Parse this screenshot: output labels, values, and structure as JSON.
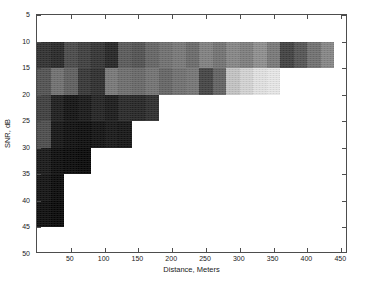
{
  "chart_data": {
    "type": "heatmap",
    "title": "",
    "xlabel": "Distance, Meters",
    "ylabel": "SNR, dB",
    "xlim": [
      0,
      460
    ],
    "ylim": [
      50,
      5
    ],
    "y_axis_inverted": true,
    "grid": false,
    "legend": null,
    "colormap": "gray",
    "xticks": [
      50,
      100,
      150,
      200,
      250,
      300,
      350,
      400,
      450
    ],
    "yticks": [
      5,
      10,
      15,
      20,
      25,
      30,
      35,
      40,
      45,
      50
    ],
    "xtick_labels": [
      "50",
      "100",
      "150",
      "200",
      "250",
      "300",
      "350",
      "400",
      "450"
    ],
    "ytick_labels": [
      "5",
      "10",
      "15",
      "20",
      "25",
      "30",
      "35",
      "40",
      "45",
      "50"
    ],
    "cell_width_m": 20,
    "cell_height_db": 5,
    "value_range": [
      0.05,
      0.87
    ],
    "x_bin_edges": [
      0,
      20,
      40,
      60,
      80,
      100,
      120,
      140,
      160,
      180,
      200,
      220,
      240,
      260,
      280,
      300,
      320,
      340,
      360,
      380,
      400,
      420,
      440
    ],
    "y_bin_edges": [
      10,
      15,
      20,
      25,
      30,
      35,
      40,
      45
    ],
    "rows": [
      {
        "snr_range": [
          10,
          15
        ],
        "x_start": 0,
        "values": [
          0.21,
          0.18,
          0.3,
          0.26,
          0.22,
          0.17,
          0.36,
          0.33,
          0.4,
          0.44,
          0.47,
          0.42,
          0.5,
          0.45,
          0.52,
          0.49,
          0.55,
          0.47,
          0.27,
          0.34,
          0.44,
          0.52
        ]
      },
      {
        "snr_range": [
          15,
          20
        ],
        "x_start": 0,
        "values": [
          0.33,
          0.44,
          0.38,
          0.23,
          0.2,
          0.47,
          0.43,
          0.41,
          0.45,
          0.4,
          0.44,
          0.46,
          0.28,
          0.39,
          0.74,
          0.8,
          0.85,
          0.87
        ]
      },
      {
        "snr_range": [
          20,
          25
        ],
        "x_start": 0,
        "values": [
          0.26,
          0.14,
          0.1,
          0.12,
          0.16,
          0.13,
          0.18,
          0.17,
          0.2
        ]
      },
      {
        "snr_range": [
          25,
          30
        ],
        "x_start": 0,
        "values": [
          0.31,
          0.11,
          0.09,
          0.08,
          0.1,
          0.12,
          0.11
        ]
      },
      {
        "snr_range": [
          30,
          35
        ],
        "x_start": 0,
        "values": [
          0.12,
          0.08,
          0.07,
          0.06
        ]
      },
      {
        "snr_range": [
          35,
          40
        ],
        "x_start": 0,
        "values": [
          0.1,
          0.07
        ]
      },
      {
        "snr_range": [
          40,
          45
        ],
        "x_start": 0,
        "values": [
          0.08,
          0.06
        ]
      }
    ]
  }
}
